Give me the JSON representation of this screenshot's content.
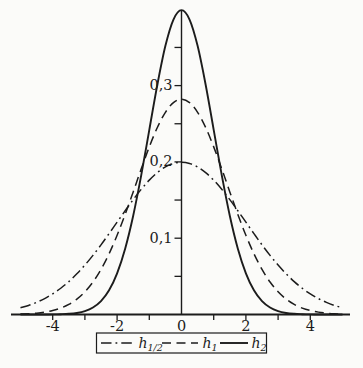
{
  "figure": {
    "background": "#fbfbf9",
    "ink": "#1c1c1c"
  },
  "chart_data": {
    "type": "line",
    "title": "",
    "xlabel": "",
    "ylabel": "",
    "xlim": [
      -5.25,
      5.25
    ],
    "ylim": [
      0,
      0.4
    ],
    "grid": false,
    "legend_position": "bottom",
    "x_axis": {
      "ticks": [
        -4,
        -3,
        -2,
        -1,
        1,
        2,
        3,
        4
      ],
      "labels": [
        {
          "v": -4,
          "t": "-4"
        },
        {
          "v": -2,
          "t": "-2"
        },
        {
          "v": 0,
          "t": "0"
        },
        {
          "v": 2,
          "t": "2"
        },
        {
          "v": 4,
          "t": "4"
        }
      ]
    },
    "y_axis": {
      "ticks": [
        0.05,
        0.1,
        0.15,
        0.2,
        0.25,
        0.3,
        0.35
      ],
      "labels": [
        {
          "v": 0.1,
          "t": "0,1"
        },
        {
          "v": 0.2,
          "t": "0,2"
        },
        {
          "v": 0.3,
          "t": "0,3"
        }
      ]
    },
    "x": [
      -5,
      -4.75,
      -4.5,
      -4.25,
      -4,
      -3.75,
      -3.5,
      -3.25,
      -3,
      -2.75,
      -2.5,
      -2.25,
      -2,
      -1.75,
      -1.5,
      -1.25,
      -1,
      -0.75,
      -0.5,
      -0.25,
      0,
      0.25,
      0.5,
      0.75,
      1,
      1.25,
      1.5,
      1.75,
      2,
      2.25,
      2.5,
      2.75,
      3,
      3.25,
      3.5,
      3.75,
      4,
      4.25,
      4.5,
      4.75,
      5
    ],
    "series": [
      {
        "id": "h-half",
        "label_base": "h",
        "label_sub": "1/2",
        "style": "dash-dot",
        "peak": 0.1995,
        "values": [
          0.0088,
          0.0119,
          0.0159,
          0.0209,
          0.027,
          0.0344,
          0.0431,
          0.0533,
          0.0648,
          0.0775,
          0.0913,
          0.106,
          0.121,
          0.136,
          0.1506,
          0.1641,
          0.1761,
          0.186,
          0.1934,
          0.1979,
          0.1995,
          0.1979,
          0.1934,
          0.186,
          0.1761,
          0.1641,
          0.1506,
          0.136,
          0.121,
          0.106,
          0.0913,
          0.0775,
          0.0648,
          0.0533,
          0.0431,
          0.0344,
          0.027,
          0.0209,
          0.0159,
          0.0119,
          0.0088
        ]
      },
      {
        "id": "h-1",
        "label_base": "h",
        "label_sub": "1",
        "style": "dashed",
        "peak": 0.2821,
        "values": [
          0.0005,
          0.001,
          0.0018,
          0.0031,
          0.0052,
          0.0084,
          0.0132,
          0.0201,
          0.0297,
          0.0426,
          0.0591,
          0.0796,
          0.1038,
          0.1312,
          0.1607,
          0.1909,
          0.2197,
          0.2451,
          0.265,
          0.2777,
          0.2821,
          0.2777,
          0.265,
          0.2451,
          0.2197,
          0.1909,
          0.1607,
          0.1312,
          0.1038,
          0.0796,
          0.0591,
          0.0426,
          0.0297,
          0.0201,
          0.0132,
          0.0084,
          0.0052,
          0.0031,
          0.0018,
          0.001,
          0.0005
        ]
      },
      {
        "id": "h-2",
        "label_base": "h",
        "label_sub": "2",
        "style": "solid",
        "peak": 0.3989,
        "values": [
          0,
          0,
          0,
          0,
          0.0001,
          0.0004,
          0.0009,
          0.002,
          0.0044,
          0.0091,
          0.0175,
          0.0317,
          0.054,
          0.0863,
          0.1295,
          0.1826,
          0.242,
          0.3011,
          0.3521,
          0.3866,
          0.3989,
          0.3866,
          0.3521,
          0.3011,
          0.242,
          0.1826,
          0.1295,
          0.0863,
          0.054,
          0.0317,
          0.0175,
          0.0091,
          0.0044,
          0.002,
          0.0009,
          0.0004,
          0.0001,
          0,
          0,
          0,
          0
        ]
      }
    ]
  }
}
